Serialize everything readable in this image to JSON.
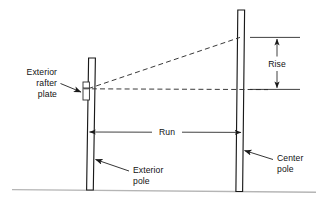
{
  "figure": {
    "background_color": "#ffffff",
    "line_color": "#1a1a1a",
    "dashed_line_color": "#3a3a3a",
    "ground_line_color": "#b5b5b5",
    "width": 327,
    "height": 200
  },
  "labels": {
    "exterior_rafter_plate": {
      "line1": "Exterior",
      "line2": "rafter",
      "line3": "plate"
    },
    "rise": "Rise",
    "run": "Run",
    "exterior_pole": {
      "line1": "Exterior",
      "line2": "pole"
    },
    "center_pole": {
      "line1": "Center",
      "line2": "pole"
    }
  },
  "elements": {
    "exterior_pole_name": "exterior-pole",
    "center_pole_name": "center-pole",
    "rafter_plate_name": "exterior-rafter-plate",
    "rafter_line_name": "rafter-slope-line",
    "level_line_name": "level-reference-line",
    "rise_dimension_name": "rise-dimension",
    "run_dimension_name": "run-dimension",
    "ground_line_name": "ground-line"
  }
}
